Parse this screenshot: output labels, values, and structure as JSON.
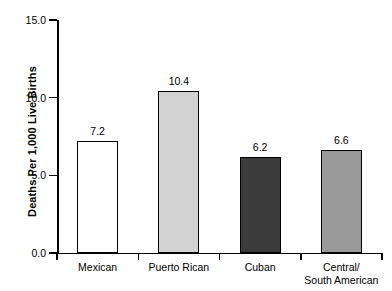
{
  "chart_data": {
    "type": "bar",
    "title": "",
    "subtitle": "",
    "xlabel": "",
    "ylabel": "Deaths Per 1,000 Live Births",
    "ylim": [
      0.0,
      15.0
    ],
    "ytick_labels": [
      "15.0",
      "10.0",
      "5.0",
      "0.0"
    ],
    "ytick_values": [
      15.0,
      10.0,
      5.0,
      0.0
    ],
    "grid": false,
    "legend": null,
    "categories": [
      "Mexican",
      "Puerto Rican",
      "Cuban",
      "Central/ South American"
    ],
    "values": [
      7.2,
      10.4,
      6.2,
      6.6
    ],
    "value_labels": [
      "7.2",
      "10.4",
      "6.2",
      "6.6"
    ],
    "bars": [
      {
        "category": "Mexican",
        "category_lines": [
          "Mexican",
          ""
        ],
        "value": 7.2,
        "value_label": "7.2",
        "fill": "#ffffff",
        "stroke": "#000000"
      },
      {
        "category": "Puerto Rican",
        "category_lines": [
          "Puerto Rican",
          ""
        ],
        "value": 10.4,
        "value_label": "10.4",
        "fill": "#d2d2d2",
        "stroke": "#000000"
      },
      {
        "category": "Cuban",
        "category_lines": [
          "Cuban",
          ""
        ],
        "value": 6.2,
        "value_label": "6.2",
        "fill": "#3b3b3b",
        "stroke": "#000000"
      },
      {
        "category": "Central/ South American",
        "category_lines": [
          "Central/",
          "South American"
        ],
        "value": 6.6,
        "value_label": "6.6",
        "fill": "#9a9a9a",
        "stroke": "#000000"
      }
    ]
  }
}
